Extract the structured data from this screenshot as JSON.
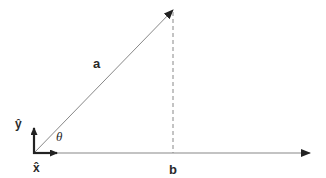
{
  "diagram": {
    "colors": {
      "line": "#888888",
      "axis": "#222222",
      "text": "#2a2a2a"
    },
    "origin": [
      34,
      153
    ],
    "vector_a": {
      "label": "a",
      "tip": [
        173,
        10
      ]
    },
    "projection_b": {
      "label": "b",
      "x": 173
    },
    "x_axis": {
      "label": "x̂",
      "end": [
        310,
        153
      ]
    },
    "unit_y": {
      "label": "ŷ"
    },
    "angle": {
      "label": "θ"
    }
  }
}
